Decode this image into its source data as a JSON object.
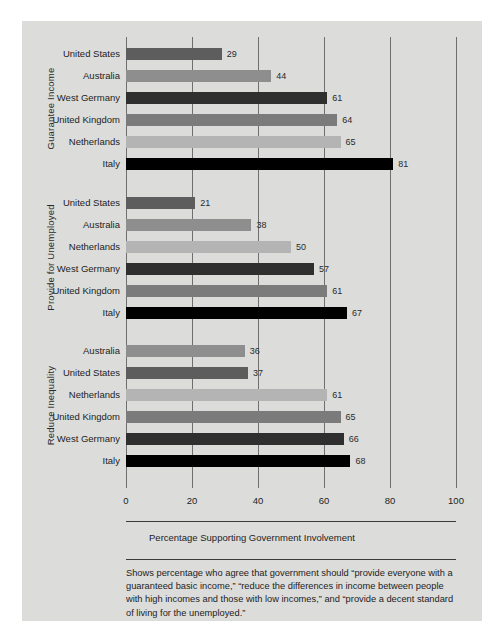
{
  "chart_data": {
    "type": "bar",
    "orientation": "horizontal",
    "title": "",
    "xlabel": "Percentage Supporting Government Involvement",
    "ylabel": "",
    "xlim": [
      0,
      100
    ],
    "xticks": [
      0,
      20,
      40,
      60,
      80,
      100
    ],
    "grid": true,
    "legend": "none",
    "caption": "Shows percentage who agree that government should “provide everyone with a guaranteed basic income,” “reduce the differences in income between people with high incomes and those with low incomes,” and “provide a decent standard of living for the unemployed.”",
    "groups": [
      {
        "label": "Guarantee Income",
        "categories": [
          "United States",
          "Australia",
          "West Germany",
          "United Kingdom",
          "Netherlands",
          "Italy"
        ],
        "values": [
          29,
          44,
          61,
          64,
          65,
          81
        ]
      },
      {
        "label": "Provide for Unemployed",
        "categories": [
          "United States",
          "Australia",
          "Netherlands",
          "West Germany",
          "United Kingdom",
          "Italy"
        ],
        "values": [
          21,
          38,
          50,
          57,
          61,
          67
        ]
      },
      {
        "label": "Reduce Inequality",
        "categories": [
          "Australia",
          "United States",
          "Netherlands",
          "United Kingdom",
          "West Germany",
          "Italy"
        ],
        "values": [
          36,
          37,
          61,
          65,
          66,
          68
        ]
      }
    ],
    "country_colors": {
      "United States": "#5d5d5d",
      "Australia": "#8e8e8e",
      "Netherlands": "#b4b4b4",
      "West Germany": "#2f2f2f",
      "United Kingdom": "#7b7b7b",
      "Italy": "#000000"
    },
    "panel_color": "#dcdcda",
    "gridline_color": "#6f6f6f",
    "axis_color": "#3a3a3a"
  }
}
